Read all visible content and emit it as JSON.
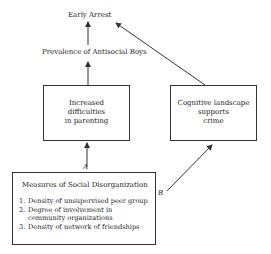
{
  "nodes": {
    "early_arrest": "Early Arrest",
    "prevalence": "Prevalence of Antisocial Boys",
    "parenting": [
      "Increased",
      "difficulties",
      "in parenting"
    ],
    "cognitive": [
      "Cognitive landscape",
      "supports",
      "crime"
    ],
    "social_disorg": {
      "title": "Measures of Social Disorganization",
      "items": [
        {
          "num": "1.",
          "lines": [
            "Density of unsupervised peer group"
          ]
        },
        {
          "num": "2.",
          "lines": [
            "Degree of involvement in",
            "community organizations"
          ]
        },
        {
          "num": "3.",
          "lines": [
            "Density of network of friendships"
          ]
        }
      ]
    }
  },
  "edges": {
    "a_label": "A",
    "b_label": "B"
  }
}
